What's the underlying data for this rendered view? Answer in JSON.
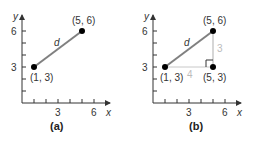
{
  "panels": [
    {
      "caption": "(a)",
      "axis_x_label": "x",
      "axis_y_label": "y",
      "x_ticks": [
        "3",
        "6"
      ],
      "y_ticks": [
        "3",
        "6"
      ],
      "segment_label": "d",
      "points": [
        {
          "label": "(1, 3)",
          "x": 1,
          "y": 3
        },
        {
          "label": "(5, 6)",
          "x": 5,
          "y": 6
        }
      ]
    },
    {
      "caption": "(b)",
      "axis_x_label": "x",
      "axis_y_label": "y",
      "x_ticks": [
        "3",
        "6"
      ],
      "y_ticks": [
        "3",
        "6"
      ],
      "segment_label": "d",
      "points": [
        {
          "label": "(1, 3)",
          "x": 1,
          "y": 3
        },
        {
          "label": "(5, 6)",
          "x": 5,
          "y": 6
        },
        {
          "label": "(5, 3)",
          "x": 5,
          "y": 3
        }
      ],
      "horizontal_leg_label": "4",
      "vertical_leg_label": "3"
    }
  ],
  "colors": {
    "segment": "#808080",
    "legs": "#c8c8c8",
    "axis": "#333333",
    "point": "#000000"
  }
}
